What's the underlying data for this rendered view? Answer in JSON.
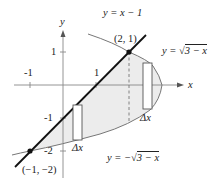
{
  "figure": {
    "type": "region-between-curves",
    "axes": {
      "x_label": "x",
      "y_label": "y",
      "x_ticks": [
        "-1",
        "1"
      ],
      "y_ticks": [
        "1",
        "-1",
        "-2"
      ]
    },
    "curves": [
      {
        "label": "y = x − 1",
        "equation": "y = x - 1",
        "style": "thick-black-line"
      },
      {
        "label_prefix": "y = ",
        "label_radical": "3 − x",
        "equation": "y = sqrt(3 - x)",
        "style": "thin-gray-curve"
      },
      {
        "label_prefix": "y = −",
        "label_radical": "3 − x",
        "equation": "y = -sqrt(3 - x)",
        "style": "thin-gray-curve"
      }
    ],
    "points": [
      {
        "label": "(2, 1)",
        "x": 2,
        "y": 1
      },
      {
        "label": "(−1, −2)",
        "x": -1,
        "y": -2
      }
    ],
    "rectangles": [
      {
        "label": "Δx",
        "position": "left region, between line and lower parabola"
      },
      {
        "label": "Δx",
        "position": "right region, between upper and lower parabola"
      }
    ],
    "shading_color": "#ececec",
    "line_color": "#111111",
    "curve_color": "#777777"
  }
}
